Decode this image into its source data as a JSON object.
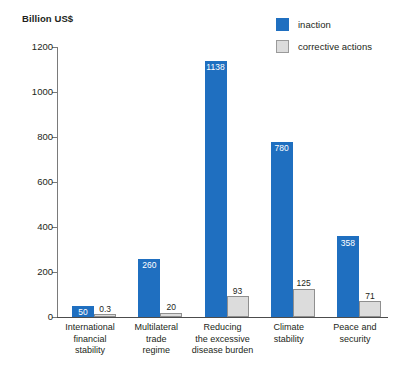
{
  "chart_data": {
    "type": "bar",
    "title": "",
    "ylabel": "Billion US$",
    "xlabel": "",
    "ylim": [
      0,
      1200
    ],
    "yticks": [
      0,
      200,
      400,
      600,
      800,
      1000,
      1200
    ],
    "ytick_labels": [
      "0",
      "200",
      "400",
      "600",
      "800",
      "1000",
      "1200"
    ],
    "grid": false,
    "legend_position": "top-right",
    "categories": [
      "International financial stability",
      "Multilateral trade regime",
      "Reducing the excessive disease burden",
      "Climate stability",
      "Peace and security"
    ],
    "category_lines": [
      [
        "International",
        "financial",
        "stability"
      ],
      [
        "Multilateral",
        "trade",
        "regime"
      ],
      [
        "Reducing",
        "the excessive",
        "disease burden"
      ],
      [
        "Climate",
        "stability"
      ],
      [
        "Peace and",
        "security"
      ]
    ],
    "series": [
      {
        "name": "inaction",
        "color": "#1f6fc0",
        "values": [
          50,
          260,
          1138,
          780,
          358
        ],
        "labels": [
          "50",
          "260",
          "1138",
          "780",
          "358"
        ]
      },
      {
        "name": "corrective actions",
        "color": "#dcdcdc",
        "values": [
          0.3,
          20,
          93,
          125,
          71
        ],
        "labels": [
          "0.3",
          "20",
          "93",
          "125",
          "71"
        ]
      }
    ]
  },
  "legend": {
    "items": [
      {
        "label": "inaction",
        "swatch": "blue"
      },
      {
        "label": "corrective actions",
        "swatch": "gray"
      }
    ]
  }
}
